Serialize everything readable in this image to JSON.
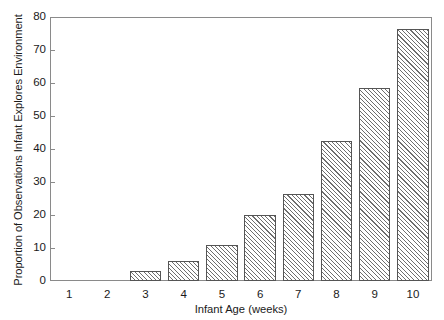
{
  "chart_data": {
    "type": "bar",
    "title": "",
    "subtitle": "",
    "xlabel": "Infant Age (weeks)",
    "ylabel": "Proportion of Observations Infant Explores Environment",
    "categories": [
      "1",
      "2",
      "3",
      "4",
      "5",
      "6",
      "7",
      "8",
      "9",
      "10"
    ],
    "values": [
      0,
      0,
      3,
      6,
      11,
      20,
      26.5,
      42.5,
      58.5,
      76.5
    ],
    "xlim": [
      0.5,
      10.5
    ],
    "ylim": [
      0,
      80
    ],
    "yticks": [
      0,
      10,
      20,
      30,
      40,
      50,
      60,
      70,
      80
    ],
    "ytick_labels": [
      "0",
      "10",
      "20",
      "30",
      "40",
      "50",
      "60",
      "70",
      "80"
    ],
    "xticks": [
      1,
      2,
      3,
      4,
      5,
      6,
      7,
      8,
      9,
      10
    ],
    "xtick_labels": [
      "1",
      "2",
      "3",
      "4",
      "5",
      "6",
      "7",
      "8",
      "9",
      "10"
    ],
    "grid": false,
    "legend": null,
    "legend_position": "none",
    "bar_fill": "hatched-diagonal",
    "bar_edge_color": "#555555",
    "bar_face_color": "#ffffff",
    "hatch_color": "#6e6e6e",
    "axis_color": "#8a8a8a",
    "text_color": "#1a1a1a",
    "background": "#ffffff",
    "annotations": []
  }
}
